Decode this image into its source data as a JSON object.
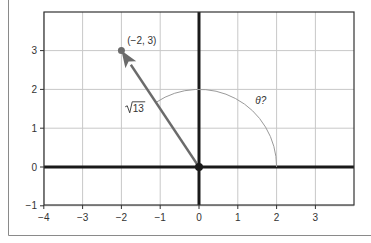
{
  "chart_data": {
    "type": "scatter",
    "title": "",
    "xlabel": "",
    "ylabel": "",
    "xlim": [
      -4,
      4
    ],
    "ylim": [
      -1,
      4
    ],
    "grid": true,
    "x_ticks": [
      -4,
      -3,
      -2,
      -1,
      0,
      1,
      2,
      3
    ],
    "y_ticks": [
      -1,
      0,
      1,
      2,
      3
    ],
    "x_tick_labels": [
      "−4",
      "−3",
      "−2",
      "−1",
      "0",
      "1",
      "2",
      "3"
    ],
    "y_tick_labels": [
      "−1",
      "0",
      "1",
      "2",
      "3"
    ],
    "vector": {
      "from": [
        0,
        0
      ],
      "to": [
        -2,
        3
      ],
      "color": "#6b6b6b"
    },
    "points": [
      {
        "x": 0,
        "y": 0,
        "label": ""
      },
      {
        "x": -2,
        "y": 3,
        "label": "(−2, 3)"
      }
    ],
    "arc": {
      "center": [
        0,
        0
      ],
      "radius": 2,
      "start_angle_deg": 0,
      "end_angle_deg": 123.69,
      "color": "#9a9a9a"
    },
    "annotations": [
      {
        "text": "(−2, 3)",
        "x": -1.85,
        "y": 3.25
      },
      {
        "text": "√13",
        "x": -1.85,
        "y": 1.5,
        "radicand": "13"
      },
      {
        "text": "θ?",
        "x": 1.45,
        "y": 1.7
      }
    ],
    "colors": {
      "axis": "#1a1a1a",
      "grid": "#c8c8c8",
      "frame": "#333333",
      "outer_border": "#8a8a8a"
    }
  }
}
